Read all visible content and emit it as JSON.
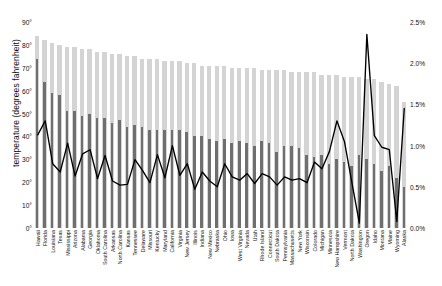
{
  "chart_data": {
    "type": "bar",
    "title": "",
    "subtitle": "",
    "ylabel": "temperature (degrees fahrenheit)",
    "xlabel": "",
    "ylim": [
      0,
      90
    ],
    "y2lim": [
      0.0,
      2.5
    ],
    "y2label": "",
    "grid": false,
    "legend_position": "none",
    "yticks": [
      "0°",
      "10°",
      "20°",
      "30°",
      "40°",
      "50°",
      "60°",
      "70°",
      "80°",
      "90°"
    ],
    "ytick_values": [
      0,
      10,
      20,
      30,
      40,
      50,
      60,
      70,
      80,
      90
    ],
    "y2ticks": [
      "0.0%",
      "0.5%",
      "1.0%",
      "1.5%",
      "2.0%",
      "2.5%"
    ],
    "y2tick_values": [
      0.0,
      0.5,
      1.0,
      1.5,
      2.0,
      2.5
    ],
    "categories": [
      "Hawaii",
      "Florida",
      "Louisiana",
      "Texas",
      "Mississippi",
      "Arizona",
      "Alabama",
      "Georgia",
      "Oklahoma",
      "South Carolina",
      "Arkansas",
      "North Carolina",
      "Kansas",
      "Tennessee",
      "Delaware",
      "Missouri",
      "Kentucky",
      "Maryland",
      "California",
      "Virginia",
      "New Jersey",
      "Illinois",
      "Indiana",
      "New Mexico",
      "Nebraska",
      "Ohio",
      "Iowa",
      "West Virginia",
      "Nevada",
      "Utah",
      "Rhode Island",
      "Connecticut",
      "South Dakota",
      "Pennsylvania",
      "Massachusetts",
      "New York",
      "Wisconsin",
      "Colorado",
      "Michigan",
      "Minnesota",
      "New Hampshire",
      "Vermont",
      "North Dakota",
      "Washington",
      "Oregon",
      "Idaho",
      "Montana",
      "Maine",
      "Wyoming",
      "Alaska"
    ],
    "series": [
      {
        "name": "average high temperature",
        "axis": "left",
        "color": "#d4d4d4",
        "values": [
          84,
          82,
          81,
          80,
          79,
          79,
          78,
          78,
          77,
          77,
          76,
          76,
          75,
          75,
          74,
          74,
          74,
          73,
          73,
          73,
          72,
          72,
          71,
          71,
          71,
          71,
          70,
          70,
          70,
          70,
          69,
          69,
          69,
          69,
          68,
          68,
          68,
          68,
          67,
          67,
          67,
          66,
          66,
          66,
          65,
          65,
          64,
          63,
          62,
          55
        ]
      },
      {
        "name": "average low temperature",
        "axis": "left",
        "color": "#6f6f6f",
        "values": [
          74,
          64,
          59,
          58,
          51,
          51,
          49,
          50,
          48,
          48,
          46,
          47,
          44,
          45,
          44,
          43,
          43,
          43,
          43,
          43,
          42,
          40,
          40,
          39,
          38,
          39,
          37,
          38,
          37,
          36,
          38,
          37,
          33,
          36,
          36,
          35,
          32,
          31,
          32,
          28,
          30,
          29,
          27,
          32,
          30,
          28,
          25,
          27,
          22,
          18
        ]
      },
      {
        "name": "percentage",
        "axis": "right",
        "color": "#000000",
        "values": [
          1.13,
          1.3,
          0.78,
          0.68,
          1.03,
          0.63,
          0.9,
          0.95,
          0.6,
          0.88,
          0.57,
          0.52,
          0.53,
          0.83,
          0.7,
          0.55,
          0.89,
          0.61,
          1.0,
          0.64,
          0.78,
          0.47,
          0.68,
          0.57,
          0.5,
          0.78,
          0.62,
          0.58,
          0.66,
          0.54,
          0.66,
          0.62,
          0.52,
          0.62,
          0.58,
          0.6,
          0.55,
          0.8,
          0.72,
          0.93,
          1.3,
          1.05,
          0.55,
          0.06,
          2.35,
          1.12,
          0.98,
          0.95,
          0.08,
          1.45
        ]
      }
    ]
  }
}
